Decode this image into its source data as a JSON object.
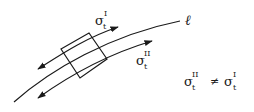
{
  "diagram": {
    "curve_label": "ℓ",
    "upper_stress": {
      "base": "σ",
      "sub": "t",
      "sup": "I"
    },
    "lower_stress": {
      "base": "σ",
      "sub": "t",
      "sup": "II"
    },
    "equation": {
      "lhs": {
        "base": "σ",
        "sub": "t",
        "sup": "II"
      },
      "operator": "≠",
      "rhs": {
        "base": "σ",
        "sub": "t",
        "sup": "I"
      }
    },
    "colors": {
      "stroke": "#1a1a1a",
      "background": "#ffffff"
    }
  }
}
